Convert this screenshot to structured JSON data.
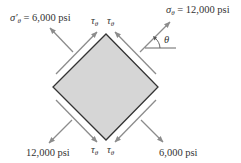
{
  "diagram": {
    "type": "stress-element",
    "element": {
      "shape": "square rotated 45°",
      "fill": "#d6d6d6",
      "edge_color": "#333333",
      "vertices": {
        "top": [
          106,
          34
        ],
        "right": [
          158,
          87
        ],
        "bottom": [
          106,
          140
        ],
        "left": [
          53,
          87
        ]
      }
    },
    "arrow_color": "#8c8c8c",
    "labels": {
      "sigma_prime_theta": {
        "symbol": "σ′",
        "subscript": "θ",
        "text": " = 6,000 psi"
      },
      "sigma_theta": {
        "symbol": "σ",
        "subscript": "θ",
        "text": " = 12,000 psi"
      },
      "tau_top_left": {
        "symbol": "τ",
        "subscript": "θ"
      },
      "tau_top_right": {
        "symbol": "τ",
        "subscript": "θ"
      },
      "tau_bottom_left": {
        "symbol": "τ",
        "subscript": "θ"
      },
      "tau_bottom_right": {
        "symbol": "τ",
        "subscript": "θ"
      },
      "bottom_left_stress": "12,000 psi",
      "bottom_right_stress": "6,000 psi",
      "angle": "θ"
    },
    "forces": [
      {
        "face": "upper-right",
        "kind": "normal",
        "value": "12,000 psi",
        "direction": "outward"
      },
      {
        "face": "lower-left",
        "kind": "normal",
        "value": "12,000 psi",
        "direction": "outward"
      },
      {
        "face": "upper-left",
        "kind": "normal",
        "value": "6,000 psi",
        "direction": "outward"
      },
      {
        "face": "lower-right",
        "kind": "normal",
        "value": "6,000 psi",
        "direction": "outward"
      },
      {
        "face": "all four",
        "kind": "shear",
        "symbol": "τθ"
      }
    ]
  }
}
